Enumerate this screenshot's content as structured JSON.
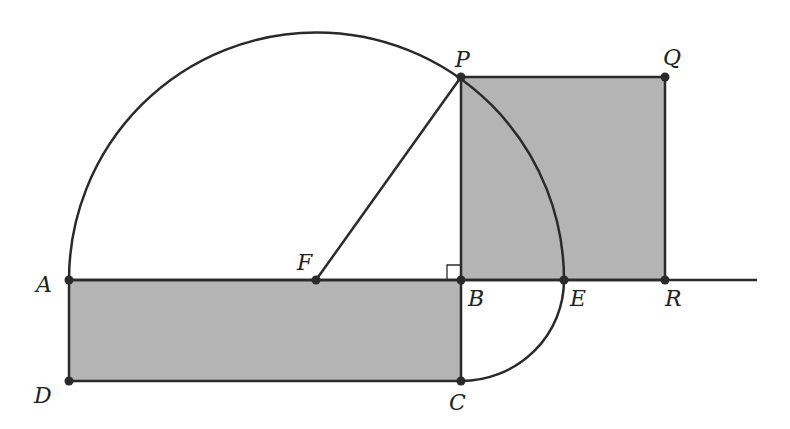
{
  "figure": {
    "colors": {
      "stroke": "#2a2a2a",
      "fill": "#b4b4b4",
      "background": "#ffffff"
    },
    "points": {
      "A": {
        "label": "A",
        "x": 69,
        "y": 280
      },
      "B": {
        "label": "B",
        "x": 461,
        "y": 280
      },
      "C": {
        "label": "C",
        "x": 461,
        "y": 381
      },
      "D": {
        "label": "D",
        "x": 69,
        "y": 381
      },
      "E": {
        "label": "E",
        "x": 564,
        "y": 280
      },
      "F": {
        "label": "F",
        "x": 316,
        "y": 280
      },
      "P": {
        "label": "P",
        "x": 461,
        "y": 77
      },
      "Q": {
        "label": "Q",
        "x": 665,
        "y": 77
      },
      "R": {
        "label": "R",
        "x": 665,
        "y": 280
      }
    },
    "shapes": {
      "rectangle_ABCD": "shaded",
      "square_BPQR": "shaded",
      "semicircle_AE": "center F",
      "arc_CE": "center B",
      "segment_FP": "radius",
      "ray_AR": "extends to x=757",
      "right_angle_marker": "at B between BA and BP"
    }
  }
}
